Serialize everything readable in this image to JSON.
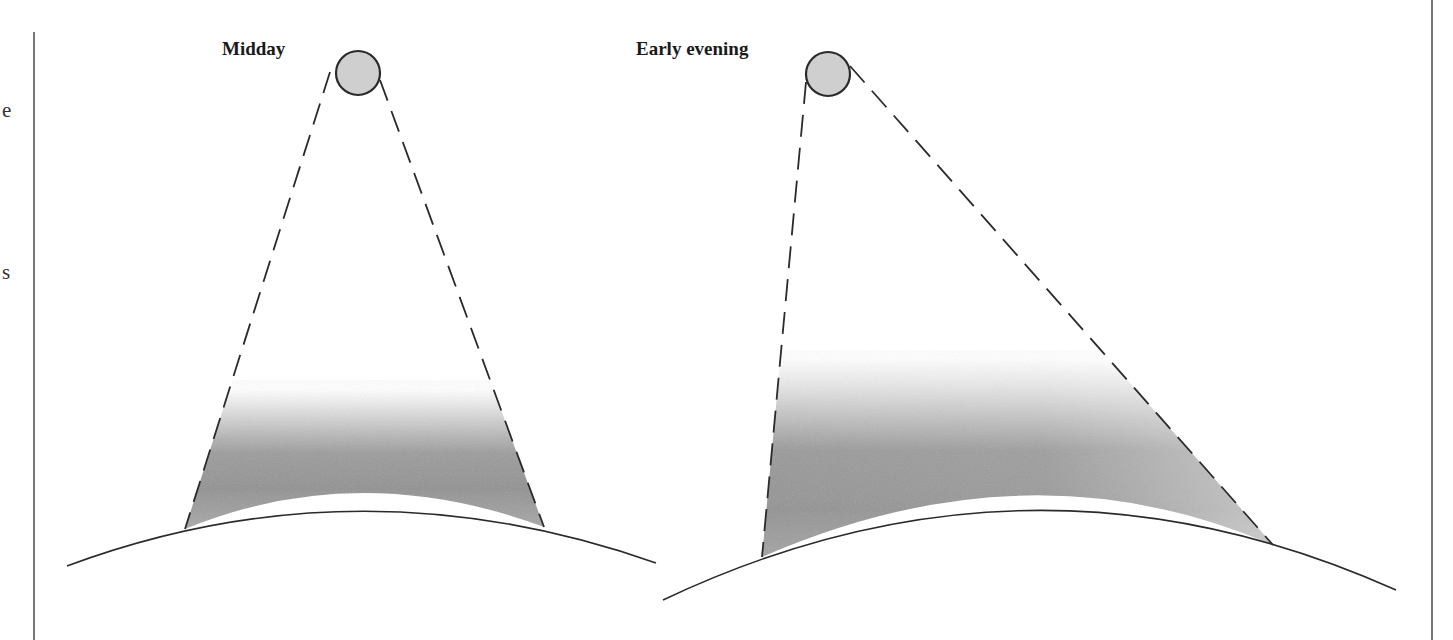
{
  "figure": {
    "panels": [
      {
        "id": "midday",
        "label": "Midday",
        "sun": {
          "cx": 358,
          "cy": 73,
          "r": 22
        },
        "beam": {
          "left_top": [
            330,
            72
          ],
          "left_bottom": [
            185,
            529
          ],
          "right_top": [
            380,
            80
          ],
          "right_bottom": [
            544,
            527
          ]
        },
        "ground": {
          "start": [
            67,
            566
          ],
          "control": [
            358,
            458
          ],
          "end": [
            656,
            563
          ]
        }
      },
      {
        "id": "early-evening",
        "label": "Early evening",
        "sun": {
          "cx": 828,
          "cy": 74,
          "r": 22
        },
        "beam": {
          "left_top": [
            806,
            82
          ],
          "left_bottom": [
            762,
            557
          ],
          "right_top": [
            850,
            66
          ],
          "right_bottom": [
            1273,
            545
          ]
        },
        "ground": {
          "start": [
            663,
            600
          ],
          "control": [
            1030,
            426
          ],
          "end": [
            1396,
            590
          ]
        }
      }
    ],
    "margin_fragments": [
      "e",
      "s"
    ],
    "colors": {
      "sun_fill": "#cfcfcf",
      "sun_stroke": "#2a2a2a",
      "line": "#2a2a2a",
      "shade_dark": "#8e8e8e",
      "shade_light": "#b5b5b5",
      "border": "#555555"
    }
  }
}
